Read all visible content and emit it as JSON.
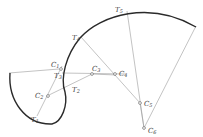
{
  "diagram": {
    "type": "compound-curve-construction",
    "colors": {
      "curve": "#2a2a2a",
      "construction": "#9a9a9a",
      "label": "#444444"
    },
    "centers": [
      {
        "id": "C1",
        "label": "C",
        "sub": "1",
        "x": 59,
        "y": 69
      },
      {
        "id": "C2",
        "label": "C",
        "sub": "2",
        "x": 47,
        "y": 96
      },
      {
        "id": "C3",
        "label": "C",
        "sub": "3",
        "x": 92,
        "y": 74
      },
      {
        "id": "C4",
        "label": "C",
        "sub": "4",
        "x": 116,
        "y": 75
      },
      {
        "id": "C5",
        "label": "C",
        "sub": "5",
        "x": 140,
        "y": 103
      },
      {
        "id": "C6",
        "label": "C",
        "sub": "6",
        "x": 144,
        "y": 128
      }
    ],
    "tangent_points": [
      {
        "id": "T1",
        "label": "T",
        "sub": "1"
      },
      {
        "id": "T2",
        "label": "T",
        "sub": "2"
      },
      {
        "id": "T3",
        "label": "T",
        "sub": "3"
      },
      {
        "id": "T4",
        "label": "T",
        "sub": "4"
      },
      {
        "id": "T5",
        "label": "T",
        "sub": "5"
      }
    ]
  }
}
